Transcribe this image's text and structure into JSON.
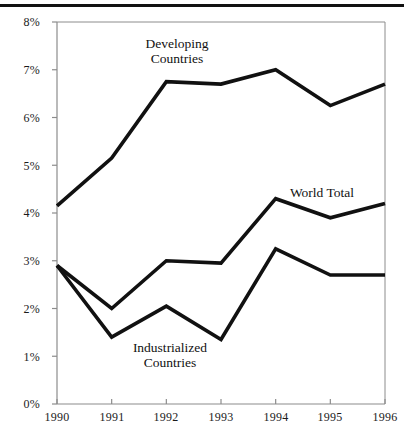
{
  "figure": {
    "background_color": "#ffffff",
    "line_color": "#111111",
    "axis_color": "#8c8c8c",
    "top_rule": true
  },
  "chart_data": {
    "type": "line",
    "title": "",
    "subtitle": "",
    "xlabel": "",
    "ylabel": "",
    "x": [
      1990,
      1991,
      1992,
      1993,
      1994,
      1995,
      1996
    ],
    "categories": [
      "1990",
      "1991",
      "1992",
      "1993",
      "1994",
      "1995",
      "1996"
    ],
    "xlim": [
      1990,
      1996
    ],
    "ylim": [
      0,
      8
    ],
    "y_tick_values": [
      0,
      1,
      2,
      3,
      4,
      5,
      6,
      7,
      8
    ],
    "y_tick_labels": [
      "0%",
      "1%",
      "2%",
      "3%",
      "4%",
      "5%",
      "6%",
      "7%",
      "8%"
    ],
    "x_tick_labels": [
      "1990",
      "1991",
      "1992",
      "1993",
      "1994",
      "1995",
      "1996"
    ],
    "grid": false,
    "legend_position": "inline-annotations",
    "units": "percent",
    "series": [
      {
        "name": "Developing Countries",
        "label_lines": [
          "Developing",
          "Countries"
        ],
        "values": [
          4.15,
          5.15,
          6.75,
          6.7,
          7.0,
          6.25,
          6.7
        ],
        "color": "#111111",
        "line_width": 3.6
      },
      {
        "name": "World Total",
        "label_lines": [
          "World Total"
        ],
        "values": [
          2.9,
          2.0,
          3.0,
          2.95,
          4.3,
          3.9,
          4.2
        ],
        "color": "#111111",
        "line_width": 3.6
      },
      {
        "name": "Industrialized Countries",
        "label_lines": [
          "Industrialized",
          "Countries"
        ],
        "values": [
          2.9,
          1.4,
          2.05,
          1.35,
          3.25,
          2.7,
          2.7
        ],
        "color": "#111111",
        "line_width": 3.6
      }
    ],
    "annotations": [
      {
        "text": "Developing Countries",
        "line1": "Developing",
        "line2": "Countries"
      },
      {
        "text": "World Total",
        "line1": "World Total",
        "line2": ""
      },
      {
        "text": "Industrialized Countries",
        "line1": "Industrialized",
        "line2": "Countries"
      }
    ]
  },
  "annotation_developing": {
    "line1": "Developing",
    "line2": "Countries"
  },
  "annotation_world": {
    "line1": "World Total"
  },
  "annotation_industrialized": {
    "line1": "Industrialized",
    "line2": "Countries"
  },
  "y_labels": {
    "p8": "8%",
    "p7": "7%",
    "p6": "6%",
    "p5": "5%",
    "p4": "4%",
    "p3": "3%",
    "p2": "2%",
    "p1": "1%",
    "p0": "0%"
  },
  "x_labels": {
    "y1990": "1990",
    "y1991": "1991",
    "y1992": "1992",
    "y1993": "1993",
    "y1994": "1994",
    "y1995": "1995",
    "y1996": "1996"
  }
}
